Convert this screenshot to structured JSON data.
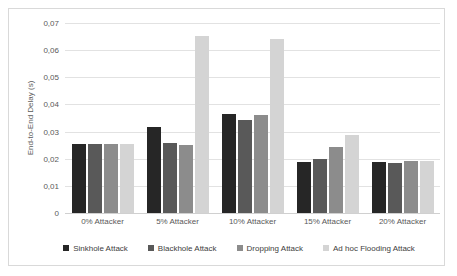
{
  "chart_data": {
    "type": "bar",
    "title": "",
    "xlabel": "",
    "ylabel": "End-to-End Delay (s)",
    "categories": [
      "0% Attacker",
      "5% Attacker",
      "10% Attacker",
      "15% Attacker",
      "20% Attacker"
    ],
    "ylim": [
      0,
      0.07
    ],
    "ytick_labels": [
      "0,07",
      "0,06",
      "0,05",
      "0,04",
      "0,03",
      "0,02",
      "0,01",
      "0"
    ],
    "ytick_values": [
      0.07,
      0.06,
      0.05,
      0.04,
      0.03,
      0.02,
      0.01,
      0
    ],
    "grid": true,
    "legend_position": "bottom",
    "decimal_separator": ",",
    "series": [
      {
        "name": "Sinkhole Attack",
        "color": "#262626",
        "values": [
          0.0253,
          0.0318,
          0.0363,
          0.0188,
          0.0187
        ]
      },
      {
        "name": "Blackhole Attack",
        "color": "#595959",
        "values": [
          0.0253,
          0.0258,
          0.0341,
          0.0199,
          0.0184
        ]
      },
      {
        "name": "Dropping Attack",
        "color": "#8c8c8c",
        "values": [
          0.0253,
          0.0249,
          0.0362,
          0.0243,
          0.0192
        ]
      },
      {
        "name": "Ad hoc Flooding Attack",
        "color": "#d4d4d4",
        "values": [
          0.0253,
          0.0652,
          0.064,
          0.0287,
          0.0192
        ]
      }
    ]
  }
}
